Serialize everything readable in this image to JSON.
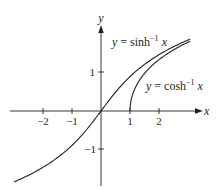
{
  "chart_data": {
    "type": "line",
    "title": "",
    "xlabel": "x",
    "ylabel": "y",
    "x_ticks": [
      "-2",
      "-1",
      "1",
      "2"
    ],
    "y_ticks": [
      "1",
      "-1"
    ],
    "xlim": [
      -3.2,
      3.3
    ],
    "ylim": [
      -2.0,
      2.2
    ],
    "grid": false,
    "legend": "inline labels",
    "series": [
      {
        "name": "y = sinh⁻¹ x",
        "function": "asinh",
        "x": [
          -3.0,
          -2.5,
          -2.0,
          -1.5,
          -1.0,
          -0.5,
          0,
          0.5,
          1.0,
          1.5,
          2.0,
          2.5,
          3.07
        ],
        "y": [
          -1.82,
          -1.65,
          -1.44,
          -1.19,
          -0.88,
          -0.48,
          0,
          0.48,
          0.88,
          1.19,
          1.44,
          1.65,
          1.84
        ]
      },
      {
        "name": "y = cosh⁻¹ x",
        "function": "acosh",
        "x": [
          1.0,
          1.1,
          1.25,
          1.5,
          2.0,
          2.5,
          3.07
        ],
        "y": [
          0,
          0.44,
          0.69,
          0.96,
          1.32,
          1.57,
          1.78
        ]
      }
    ],
    "annotations": [
      {
        "text": "y = sinh⁻¹ x",
        "near": "upper sinh curve"
      },
      {
        "text": "y = cosh⁻¹ x",
        "near": "cosh curve, right of x=1"
      }
    ]
  },
  "labels": {
    "x_axis": "x",
    "y_axis": "y",
    "tick_m2": "−2",
    "tick_m1": "−1",
    "tick_1": "1",
    "tick_2": "2",
    "ytick_1": "1",
    "ytick_m1": "−1",
    "sinh_y": "y",
    "sinh_eq": " = sinh",
    "sinh_sup": "−1",
    "sinh_x": "x",
    "cosh_y": "y",
    "cosh_eq": " = cosh",
    "cosh_sup": "−1",
    "cosh_x": "x"
  },
  "colors": {
    "ink": "#231f20",
    "background": "#ffffff"
  }
}
